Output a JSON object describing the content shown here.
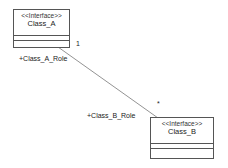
{
  "diagram": {
    "classes": [
      {
        "id": "class_a",
        "stereotype": "<<Interface>>",
        "name": "Class_A"
      },
      {
        "id": "class_b",
        "stereotype": "<<Interface>>",
        "name": "Class_B"
      }
    ],
    "association": {
      "source_role": "+Class_A_Role",
      "source_multiplicity": "1",
      "target_role": "+Class_B_Role",
      "target_multiplicity": "*"
    }
  }
}
